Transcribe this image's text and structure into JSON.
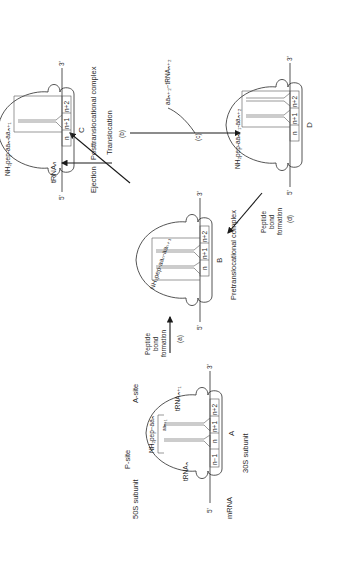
{
  "figure": {
    "orientation": "rotated 90 degrees counterclockwise"
  },
  "complex_a": {
    "letter": "A",
    "large_subunit": "50S subunit",
    "small_subunit": "30S subunit",
    "p_site": "P-site",
    "a_site": "A-site",
    "mrna": "mRNA",
    "five_prime": "5'",
    "three_prime": "3'",
    "peptide": "NH₂pep−aaₙ",
    "aa_next": "aaₙ₊₁",
    "trna_p": "tRNAₙ",
    "trna_a": "tRNAₙ₊₁",
    "codons": [
      "n−1",
      "n",
      "n+1",
      "n+2"
    ]
  },
  "complex_b": {
    "letter": "B",
    "caption": "Pretranslocational complex",
    "peptide": "NH₂pep-aaₙ-aaₙ₊₁",
    "five_prime": "5'",
    "three_prime": "3'",
    "codons": [
      "n",
      "n+1",
      "n+2"
    ]
  },
  "complex_c": {
    "letter": "C",
    "caption": "Posttranslocational complex",
    "peptide": "NH₂pep-aaₙ-aaₙ₊₁",
    "five_prime": "5'",
    "three_prime": "3'",
    "codons": [
      "n",
      "n+1",
      "n+2"
    ]
  },
  "complex_d": {
    "letter": "D",
    "peptide": "NH₂pep-aaₙ₊₁-aaₙ₊₂",
    "five_prime": "5'",
    "three_prime": "3'",
    "codons": [
      "n",
      "n+1",
      "n+2"
    ]
  },
  "steps": {
    "a": {
      "tag": "(a)",
      "label_lines": [
        "Peptide",
        "bond",
        "formation"
      ]
    },
    "b": {
      "tag": "(b)",
      "label": "Translocation"
    },
    "c": {
      "tag": "(c)",
      "incoming": "aaₙ₊₂−tRNAₙ₊₂"
    },
    "d": {
      "tag": "(d)",
      "label_lines": [
        "Peptide",
        "bond",
        "formation"
      ]
    },
    "ejection": {
      "label": "Ejection",
      "product": "tRNAₙ"
    }
  },
  "colors": {
    "ink": "#2a2a2a",
    "background": "#ffffff"
  }
}
